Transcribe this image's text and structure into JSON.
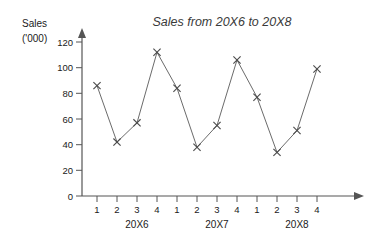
{
  "chart_data": {
    "type": "line",
    "title": "Sales from 20X6 to 20X8",
    "xlabel": "",
    "ylabel": "Sales ('000)",
    "ylabel_line1": "Sales",
    "ylabel_line2": "('000)",
    "ylim": [
      0,
      120
    ],
    "ytick_values": [
      0,
      20,
      40,
      60,
      80,
      100,
      120
    ],
    "ytick_labels": [
      "0",
      "20",
      "40",
      "60",
      "80",
      "100",
      "120"
    ],
    "grid": false,
    "legend": "none",
    "marker": "x",
    "categories": [
      "1",
      "2",
      "3",
      "4",
      "1",
      "2",
      "3",
      "4",
      "1",
      "2",
      "3",
      "4"
    ],
    "values": [
      86,
      42,
      57,
      112,
      84,
      38,
      55,
      106,
      77,
      34,
      51,
      99
    ],
    "group_labels": [
      "20X6",
      "20X7",
      "20X8"
    ],
    "groups": [
      {
        "label": "20X6",
        "quarters": [
          "1",
          "2",
          "3",
          "4"
        ],
        "values": [
          86,
          42,
          57,
          112
        ]
      },
      {
        "label": "20X7",
        "quarters": [
          "1",
          "2",
          "3",
          "4"
        ],
        "values": [
          84,
          38,
          55,
          106
        ]
      },
      {
        "label": "20X8",
        "quarters": [
          "1",
          "2",
          "3",
          "4"
        ],
        "values": [
          77,
          34,
          51,
          99
        ]
      }
    ],
    "colors": {
      "line": "#6b6b6b",
      "marker": "#4a4a4a",
      "axis": "#555555",
      "title": "#3a3a3a",
      "text": "#1a1a1a",
      "background": "#ffffff"
    }
  }
}
